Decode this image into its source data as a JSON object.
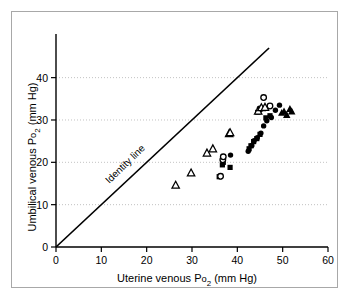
{
  "figure": {
    "background_color": "#ffffff",
    "frame_border_color": "#a8a8a8",
    "axis_color": "#000000",
    "grid_color": "#bbbbbb"
  },
  "chart_data": {
    "type": "scatter",
    "title": "",
    "xlabel_prefix": "Uterine venous P",
    "xlabel_sub": "2",
    "xlabel_suffix": "o",
    "xlabel_units": " (mm Hg)",
    "ylabel_prefix": "Umbilical venous P",
    "ylabel_sub": "2",
    "ylabel_suffix": "o",
    "ylabel_units": " (mm Hg)",
    "xlabel": "Uterine venous Po2 (mm Hg)",
    "ylabel": "Umbilical venous Po2 (mm Hg)",
    "xlim": [
      0,
      60
    ],
    "ylim": [
      0,
      47
    ],
    "xticks": [
      0,
      10,
      20,
      30,
      40,
      50,
      60
    ],
    "xtick_labels": [
      "0",
      "10",
      "20",
      "30",
      "40",
      "50",
      "60"
    ],
    "yticks": [
      0,
      10,
      20,
      30,
      40
    ],
    "ytick_labels": [
      "0",
      "10",
      "20",
      "30",
      "40"
    ],
    "grid": "horizontal-dotted",
    "legend": "none",
    "annotations": [
      {
        "text": "Identity line",
        "x": 22,
        "y": 22,
        "rotation": -44
      }
    ],
    "reference_line": {
      "label": "Identity line",
      "type": "identity",
      "x0": 0,
      "y0": 0,
      "x1": 47,
      "y1": 47
    },
    "series": [
      {
        "name": "open-triangle",
        "marker": "triangle-open",
        "color": "#000000",
        "points": [
          [
            26.4,
            14.6
          ],
          [
            29.8,
            17.5
          ],
          [
            33.3,
            22.2
          ],
          [
            34.6,
            23.2
          ],
          [
            38.2,
            26.8
          ],
          [
            38.4,
            27.0
          ],
          [
            44.6,
            32.1
          ],
          [
            45.3,
            32.9
          ],
          [
            46.1,
            33.0
          ]
        ]
      },
      {
        "name": "open-circle",
        "marker": "circle-open",
        "color": "#000000",
        "points": [
          [
            36.3,
            16.7
          ],
          [
            36.8,
            20.6
          ],
          [
            36.9,
            21.3
          ],
          [
            45.0,
            32.6
          ],
          [
            45.8,
            35.3
          ],
          [
            47.2,
            33.3
          ]
        ]
      },
      {
        "name": "filled-circle",
        "marker": "circle-filled",
        "color": "#000000",
        "points": [
          [
            38.5,
            21.7
          ],
          [
            42.4,
            22.6
          ],
          [
            43.2,
            24.0
          ],
          [
            43.7,
            25.1
          ],
          [
            44.4,
            25.8
          ],
          [
            45.2,
            26.9
          ],
          [
            45.8,
            28.6
          ],
          [
            46.5,
            29.8
          ],
          [
            47.5,
            30.6
          ],
          [
            48.4,
            32.3
          ],
          [
            49.3,
            33.5
          ]
        ]
      },
      {
        "name": "filled-square",
        "marker": "square-filled",
        "color": "#000000",
        "points": [
          [
            36.0,
            16.6
          ],
          [
            36.7,
            19.4
          ],
          [
            36.9,
            20.0
          ],
          [
            38.4,
            18.8
          ],
          [
            42.6,
            23.2
          ],
          [
            43.0,
            23.9
          ],
          [
            43.6,
            24.9
          ],
          [
            44.3,
            25.6
          ],
          [
            45.0,
            26.6
          ],
          [
            46.3,
            30.5
          ],
          [
            47.2,
            31.0
          ],
          [
            44.5,
            31.8
          ]
        ]
      },
      {
        "name": "filled-triangle",
        "marker": "triangle-filled",
        "color": "#000000",
        "points": [
          [
            49.8,
            31.7
          ],
          [
            50.3,
            32.0
          ],
          [
            50.9,
            31.2
          ],
          [
            51.6,
            32.6
          ],
          [
            52.0,
            32.0
          ]
        ]
      }
    ]
  }
}
